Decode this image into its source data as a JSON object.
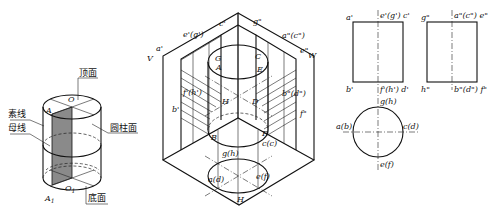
{
  "figure_left": {
    "title": "cylinder-terms",
    "labels": {
      "top_face": "顶面",
      "plain_line": "素线",
      "generatrix": "母线",
      "cylinder_surface": "圆柱面",
      "bottom_face": "底面",
      "A": "A",
      "O": "O",
      "O1": "O",
      "O1_sub": "1",
      "A1": "A",
      "A1_sub": "1"
    },
    "colors": {
      "shaded_rect": "#8a8a8a"
    }
  },
  "figure_center": {
    "title": "isometric-three-view",
    "labels": {
      "V": "V",
      "W": "W",
      "H": "H",
      "eg_prime": "e'(g')",
      "a_prime": "a'",
      "c_prime": "c'",
      "g_dprime": "g\"",
      "ac_dprime": "a\"(c\")",
      "e_dprime": "e\"",
      "fh_prime": "f'(h')",
      "bd_dprime": "b\"(d\")",
      "b_prime": "b'",
      "f_dprime": "f\"",
      "G": "G",
      "C": "C",
      "A": "A",
      "E": "E",
      "H_pt": "H",
      "D": "D",
      "B": "B",
      "F": "F",
      "gh": "g(h)",
      "cc": "c(c)",
      "ad": "a(d)",
      "ef": "e(f)"
    }
  },
  "figure_right": {
    "title": "orthographic-views",
    "front": {
      "top_left": "a'",
      "top_center": "e'(g') c'",
      "bottom_left": "b'",
      "bottom_center": "f'(h') d'"
    },
    "side": {
      "top_left": "g\"",
      "top_center": "a\"(c\") e\"",
      "bottom_left": "h\"",
      "bottom_center": "b\"(d\") f\""
    },
    "top_view": {
      "top": "g(h)",
      "left": "a(b)",
      "right": "c(d)",
      "bottom": "e(f)"
    }
  }
}
